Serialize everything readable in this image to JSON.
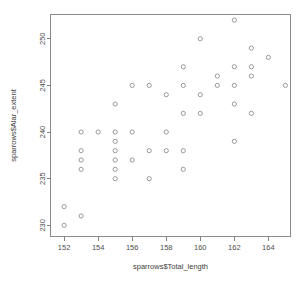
{
  "chart_data": {
    "type": "scatter",
    "title": "",
    "xlabel": "sparrows$Total_length",
    "ylabel": "sparrows$Alar_extent",
    "xlim": [
      151.2,
      165.3
    ],
    "ylim": [
      228.8,
      252.6
    ],
    "xticks": [
      152,
      154,
      156,
      158,
      160,
      162,
      164
    ],
    "xticklabels": [
      "152",
      "154",
      "156",
      "158",
      "160",
      "162",
      "164"
    ],
    "yticks": [
      230,
      235,
      240,
      245,
      250
    ],
    "yticklabels": [
      "230",
      "235",
      "240",
      "245",
      "250"
    ],
    "grid": false,
    "legend": null,
    "marker": "open-circle",
    "marker_color": "#8e8e8e",
    "points": [
      [
        152,
        232
      ],
      [
        152,
        230
      ],
      [
        153,
        231
      ],
      [
        153,
        240
      ],
      [
        153,
        238
      ],
      [
        153,
        237
      ],
      [
        153,
        236
      ],
      [
        154,
        240
      ],
      [
        155,
        243
      ],
      [
        155,
        240
      ],
      [
        155,
        239
      ],
      [
        155,
        238
      ],
      [
        155,
        237
      ],
      [
        155,
        236
      ],
      [
        155,
        235
      ],
      [
        156,
        245
      ],
      [
        156,
        240
      ],
      [
        156,
        237
      ],
      [
        157,
        245
      ],
      [
        157,
        238
      ],
      [
        157,
        235
      ],
      [
        158,
        244
      ],
      [
        158,
        240
      ],
      [
        158,
        238
      ],
      [
        159,
        247
      ],
      [
        159,
        245
      ],
      [
        159,
        242
      ],
      [
        159,
        238
      ],
      [
        159,
        236
      ],
      [
        160,
        250
      ],
      [
        160,
        244
      ],
      [
        160,
        242
      ],
      [
        161,
        246
      ],
      [
        161,
        245
      ],
      [
        162,
        252
      ],
      [
        162,
        247
      ],
      [
        162,
        245
      ],
      [
        162,
        243
      ],
      [
        162,
        239
      ],
      [
        163,
        249
      ],
      [
        163,
        247
      ],
      [
        163,
        246
      ],
      [
        163,
        242
      ],
      [
        164,
        248
      ],
      [
        165,
        245
      ]
    ]
  }
}
